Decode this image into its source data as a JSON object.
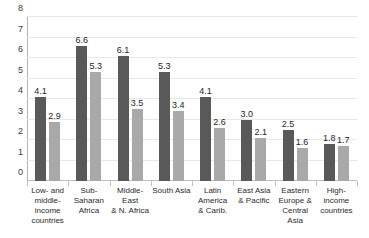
{
  "chart_data": {
    "type": "bar",
    "title": "",
    "subtitle": "",
    "xlabel": "",
    "ylabel": "",
    "ylim": [
      0,
      8
    ],
    "yticks": [
      "0",
      "1",
      "2",
      "3",
      "4",
      "5",
      "6",
      "7",
      "8"
    ],
    "grid": true,
    "legend": "none",
    "categories": [
      "Low- and middle-income countries",
      "Sub-Saharan Africa",
      "Middle-East & N. Africa",
      "South Asia",
      "Latin America & Carib.",
      "East Asia & Pacific",
      "Eastern Europe & Central Asia",
      "High-income countries"
    ],
    "category_label_lines": [
      [
        "Low- and",
        "middle-",
        "income",
        "countries"
      ],
      [
        "Sub-Saharan",
        "Africa"
      ],
      [
        "Middle-East",
        "& N. Africa"
      ],
      [
        "South Asia"
      ],
      [
        "Latin",
        "America",
        "& Carib."
      ],
      [
        "East Asia",
        "& Pacific"
      ],
      [
        "Eastern",
        "Europe &",
        "Central Asia"
      ],
      [
        "High-income",
        "countries"
      ]
    ],
    "series": [
      {
        "name": "series-1",
        "color": "#595959",
        "values": [
          4.1,
          6.6,
          6.1,
          5.3,
          4.1,
          3.0,
          2.5,
          1.8
        ],
        "labels": [
          "4.1",
          "6.6",
          "6.1",
          "5.3",
          "4.1",
          "3.0",
          "2.5",
          "1.8"
        ]
      },
      {
        "name": "series-2",
        "color": "#a9a9a9",
        "values": [
          2.9,
          5.3,
          3.5,
          3.4,
          2.6,
          2.1,
          1.6,
          1.7
        ],
        "labels": [
          "2.9",
          "5.3",
          "3.5",
          "3.4",
          "2.6",
          "2.1",
          "1.6",
          "1.7"
        ]
      }
    ]
  },
  "style": {
    "background": "#ffffff",
    "gridline_color": "#e8e8e8",
    "axis_color": "#b5b5b5",
    "text_color": "#2b2b2b"
  }
}
